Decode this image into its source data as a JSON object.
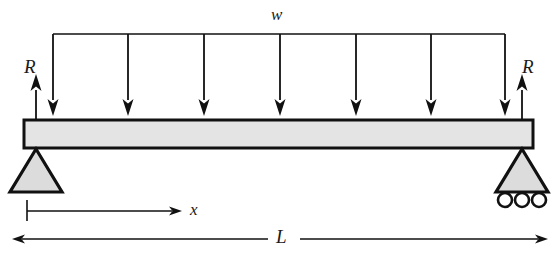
{
  "diagram": {
    "labels": {
      "distributed_load": "w",
      "reaction_left": "R",
      "reaction_right": "R",
      "position_coordinate": "x",
      "span_length": "L"
    },
    "colors": {
      "line": "#1a1a1a",
      "beam_fill": "#e4e4e4",
      "support_fill": "#dcdcdc",
      "background": "#ffffff"
    },
    "geometry": {
      "beam": {
        "x": 24,
        "y": 120,
        "width": 509,
        "height": 28
      },
      "load_line": {
        "y": 34,
        "x_start": 53,
        "x_end": 505
      },
      "load_arrow_x_positions": [
        53,
        128,
        204,
        280,
        356,
        431,
        505
      ],
      "load_arrow_tip_y": 116,
      "reaction_arrows": [
        {
          "name": "reaction-left",
          "x": 36,
          "tip_y": 74,
          "tail_y": 148
        },
        {
          "name": "reaction-right",
          "x": 522,
          "tip_y": 74,
          "tail_y": 148
        }
      ],
      "support_pin": {
        "apex_x": 36,
        "apex_y": 149,
        "base_left_x": 10,
        "base_right_x": 62,
        "base_y": 192
      },
      "support_roller": {
        "apex_x": 522,
        "apex_y": 149,
        "base_left_x": 496,
        "base_right_x": 548,
        "base_y": 192,
        "roller_centers_x": [
          505,
          522,
          539
        ],
        "roller_center_y": 200,
        "roller_radius": 7
      },
      "dimension_x": {
        "y": 211,
        "x_start": 27,
        "x_end": 180,
        "tick_top": 200,
        "tick_bottom": 221
      },
      "dimension_L": {
        "y": 239,
        "x_start": 12,
        "x_end": 548,
        "gap_start": 268,
        "gap_end": 300
      }
    }
  }
}
